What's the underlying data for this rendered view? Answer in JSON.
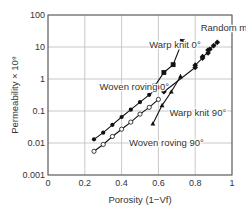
{
  "chart_data": {
    "type": "line",
    "title": "",
    "xlabel": "Porosity (1−Vf)",
    "ylabel": "Permeability × 10^9",
    "xlim": [
      0,
      1
    ],
    "ylim": [
      0.001,
      100
    ],
    "yscale": "log",
    "grid": true,
    "x_ticks": [
      "0",
      "0.2",
      "0.4",
      "0.6",
      "0.8",
      "1"
    ],
    "y_ticks": [
      "0.001",
      "0.01",
      "0.1",
      "1",
      "10",
      "100"
    ],
    "series": [
      {
        "name": "Random mat",
        "marker": "filled-diamond",
        "x": [
          0.63,
          0.8,
          0.8,
          0.84,
          0.84,
          0.87,
          0.87,
          0.88,
          0.9,
          0.92
        ],
        "y": [
          0.4,
          2.3,
          2.7,
          4.5,
          5,
          6.5,
          8,
          8.5,
          11,
          14
        ]
      },
      {
        "name": "Warp knit 0°",
        "marker": "open-then-filled-square",
        "x": [
          0.57,
          0.58,
          0.63,
          0.68,
          0.73
        ],
        "y": [
          0.5,
          0.6,
          1.6,
          2.8,
          15
        ]
      },
      {
        "name": "Warp knit 90°",
        "marker": "filled-triangle",
        "x": [
          0.57,
          0.62,
          0.67,
          0.72
        ],
        "y": [
          0.04,
          0.15,
          0.4,
          1.2
        ]
      },
      {
        "name": "Woven roving 0°",
        "marker": "filled-circle",
        "x": [
          0.25,
          0.3,
          0.35,
          0.4,
          0.45,
          0.5,
          0.55,
          0.6
        ],
        "y": [
          0.013,
          0.021,
          0.037,
          0.065,
          0.11,
          0.19,
          0.32,
          0.55
        ]
      },
      {
        "name": "Woven roving 90°",
        "marker": "open-circle",
        "x": [
          0.25,
          0.3,
          0.35,
          0.4,
          0.45,
          0.5,
          0.55,
          0.6
        ],
        "y": [
          0.0055,
          0.009,
          0.016,
          0.027,
          0.045,
          0.08,
          0.13,
          0.23
        ]
      }
    ],
    "annotations": [
      {
        "text": "Random mat",
        "x": 0.83,
        "y": 32
      },
      {
        "text": "Warp knit 0°",
        "x": 0.55,
        "y": 9
      },
      {
        "text": "Woven roving 0°",
        "x": 0.28,
        "y": 0.45
      },
      {
        "text": "Warp knit 90°",
        "x": 0.66,
        "y": 0.07
      },
      {
        "text": "Woven roving 90°",
        "x": 0.44,
        "y": 0.008
      }
    ]
  }
}
